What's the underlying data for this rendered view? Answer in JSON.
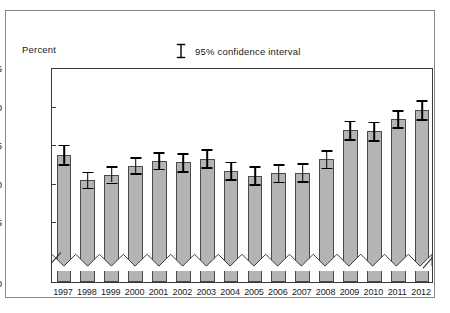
{
  "ylabel": "Percent",
  "legend": {
    "label": "95% confidence interval",
    "marker": "error-bar-marker"
  },
  "chart_data": {
    "type": "bar",
    "title": "",
    "xlabel": "",
    "ylabel": "Percent",
    "ylim": [
      35,
      55
    ],
    "yticks": [
      35,
      40,
      45,
      50,
      55
    ],
    "axis_break": {
      "present": true,
      "from": 0,
      "to": 35,
      "style": "zigzag"
    },
    "zero_tick": 0,
    "grid": false,
    "legend_position": "top-center",
    "categories": [
      "1997",
      "1998",
      "1999",
      "2000",
      "2001",
      "2002",
      "2003",
      "2004",
      "2005",
      "2006",
      "2007",
      "2008",
      "2009",
      "2010",
      "2011",
      "2012"
    ],
    "values": [
      43.6,
      40.3,
      41.0,
      42.2,
      42.8,
      42.6,
      43.1,
      41.5,
      40.9,
      41.2,
      41.3,
      43.0,
      46.8,
      46.7,
      48.3,
      49.4
    ],
    "errors_low": [
      42.4,
      39.3,
      40.0,
      41.2,
      41.8,
      41.5,
      42.0,
      40.4,
      39.8,
      40.1,
      40.2,
      41.9,
      45.6,
      45.5,
      47.2,
      48.2
    ],
    "errors_high": [
      44.9,
      41.4,
      42.1,
      43.3,
      43.9,
      43.8,
      44.3,
      42.7,
      42.1,
      42.4,
      42.5,
      44.2,
      48.0,
      47.9,
      49.4,
      50.7
    ],
    "series": [
      {
        "name": "Percent",
        "values": [
          43.6,
          40.3,
          41.0,
          42.2,
          42.8,
          42.6,
          43.1,
          41.5,
          40.9,
          41.2,
          41.3,
          43.0,
          46.8,
          46.7,
          48.3,
          49.4
        ]
      }
    ],
    "bar_color": "#b4b4b4",
    "bar_edge_color": "#4a4a4a",
    "error_color": "#000000"
  }
}
